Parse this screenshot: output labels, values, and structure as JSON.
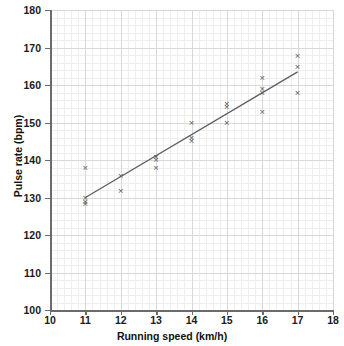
{
  "chart_data": {
    "type": "scatter",
    "title": "",
    "xlabel": "Running speed (km/h)",
    "ylabel": "Pulse rate (bpm)",
    "xlim": [
      10,
      18
    ],
    "ylim": [
      100,
      180
    ],
    "xticks": [
      10,
      11,
      12,
      13,
      14,
      15,
      16,
      17,
      18
    ],
    "yticks": [
      100,
      110,
      120,
      130,
      140,
      150,
      160,
      170,
      180
    ],
    "xtick_labels": [
      "10",
      "11",
      "12",
      "13",
      "14",
      "15",
      "16",
      "17",
      "18"
    ],
    "ytick_labels": [
      "100",
      "110",
      "120",
      "130",
      "140",
      "150",
      "160",
      "170",
      "180"
    ],
    "x_major_step": 1,
    "y_major_step": 10,
    "x_minor_step": 0.2,
    "y_minor_step": 2,
    "grid": true,
    "legend": false,
    "marker": "x",
    "marker_color": "#585858",
    "points": [
      {
        "x": 11,
        "y": 138
      },
      {
        "x": 11,
        "y": 130
      },
      {
        "x": 11,
        "y": 129
      },
      {
        "x": 11,
        "y": 128.5
      },
      {
        "x": 12,
        "y": 136
      },
      {
        "x": 12,
        "y": 132
      },
      {
        "x": 13,
        "y": 141
      },
      {
        "x": 13,
        "y": 140.2
      },
      {
        "x": 13,
        "y": 138
      },
      {
        "x": 14,
        "y": 150
      },
      {
        "x": 14,
        "y": 146
      },
      {
        "x": 14,
        "y": 145.3
      },
      {
        "x": 15,
        "y": 155
      },
      {
        "x": 15,
        "y": 154.3
      },
      {
        "x": 15,
        "y": 150
      },
      {
        "x": 16,
        "y": 162
      },
      {
        "x": 16,
        "y": 159
      },
      {
        "x": 16,
        "y": 158
      },
      {
        "x": 16,
        "y": 153
      },
      {
        "x": 17,
        "y": 168
      },
      {
        "x": 17,
        "y": 165
      },
      {
        "x": 17,
        "y": 158
      }
    ],
    "trend_line": {
      "name": "line of best fit",
      "color": "#5e5e5e",
      "x_start": 11,
      "y_start": 130,
      "x_end": 17,
      "y_end": 163.5
    }
  }
}
